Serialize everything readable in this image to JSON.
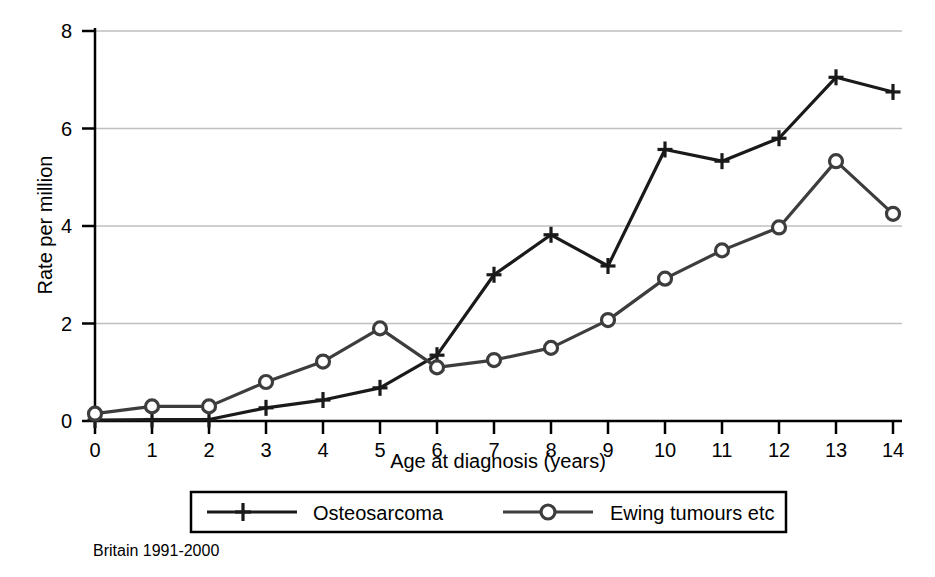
{
  "chart_data": {
    "type": "line",
    "title": "",
    "xlabel": "Age at diagnosis (years)",
    "ylabel": "Rate per million",
    "caption": "Britain 1991-2000",
    "x": [
      0,
      1,
      2,
      3,
      4,
      5,
      6,
      7,
      8,
      9,
      10,
      11,
      12,
      13,
      14
    ],
    "xtick_labels": [
      "0",
      "1",
      "2",
      "3",
      "4",
      "5",
      "6",
      "7",
      "8",
      "9",
      "10",
      "11",
      "12",
      "13",
      "14"
    ],
    "ytick_labels": [
      "0",
      "2",
      "4",
      "6",
      "8"
    ],
    "yticks": [
      0,
      2,
      4,
      6,
      8
    ],
    "xlim": [
      0,
      14
    ],
    "ylim": [
      0,
      8
    ],
    "grid": "horizontal",
    "legend_position": "below-axis",
    "series": [
      {
        "name": "Osteosarcoma",
        "marker": "plus",
        "color": "#1a1a1a",
        "values": [
          0.02,
          0.03,
          0.03,
          0.27,
          0.43,
          0.68,
          1.35,
          3.0,
          3.82,
          3.18,
          5.57,
          5.33,
          5.8,
          7.05,
          6.75
        ]
      },
      {
        "name": "Ewing tumours etc",
        "marker": "circle",
        "color": "#3d3d3d",
        "values": [
          0.15,
          0.3,
          0.3,
          0.8,
          1.22,
          1.9,
          1.1,
          1.25,
          1.5,
          2.07,
          2.92,
          3.5,
          3.97,
          5.33,
          4.25
        ]
      }
    ],
    "colors": {
      "axis": "#000000",
      "grid": "#bfbfbf",
      "background": "#ffffff",
      "osteosarcoma": "#1a1a1a",
      "ewing": "#3d3d3d"
    }
  }
}
